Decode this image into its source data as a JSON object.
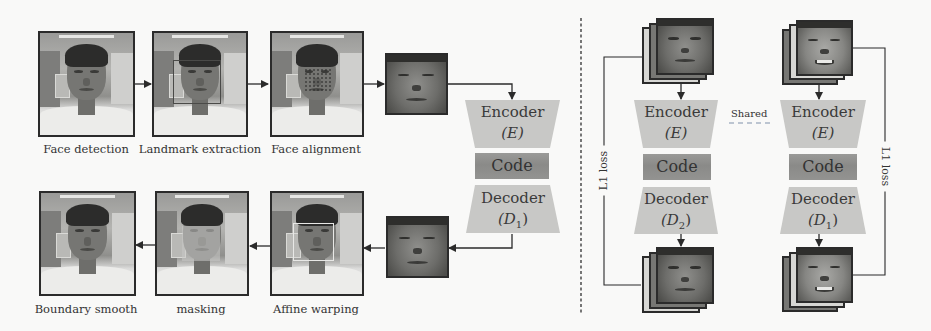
{
  "figure": {
    "left_pipeline": {
      "top_row": [
        {
          "caption": "Face detection"
        },
        {
          "caption": "Landmark extraction"
        },
        {
          "caption": "Face alignment"
        }
      ],
      "bottom_row": [
        {
          "caption": "Boundary smooth"
        },
        {
          "caption": "masking"
        },
        {
          "caption": "Affine warping"
        }
      ],
      "autoencoder": {
        "encoder": {
          "label": "Encoder",
          "symbol": "(E)"
        },
        "code": {
          "label": "Code"
        },
        "decoder": {
          "label": "Decoder",
          "symbol": "(D",
          "subscript": "1",
          "close": ")"
        }
      }
    },
    "right_training": {
      "shared_label": "Shared",
      "left_branch": {
        "encoder": {
          "label": "Encoder",
          "symbol": "(E)"
        },
        "code": {
          "label": "Code"
        },
        "decoder": {
          "label": "Decoder",
          "symbol": "(D",
          "subscript": "2",
          "close": ")"
        },
        "loss_label": "L1 loss"
      },
      "right_branch": {
        "encoder": {
          "label": "Encoder",
          "symbol": "(E)"
        },
        "code": {
          "label": "Code"
        },
        "decoder": {
          "label": "Decoder",
          "symbol": "(D",
          "subscript": "1",
          "close": ")"
        },
        "loss_label": "L1 loss"
      }
    },
    "colors": {
      "block_fill": "#c8c8c6",
      "code_fill": "#8f8f8d",
      "line": "#2b2b2b",
      "shared_dash": "#a8b4c4",
      "divider": "#555555"
    }
  }
}
